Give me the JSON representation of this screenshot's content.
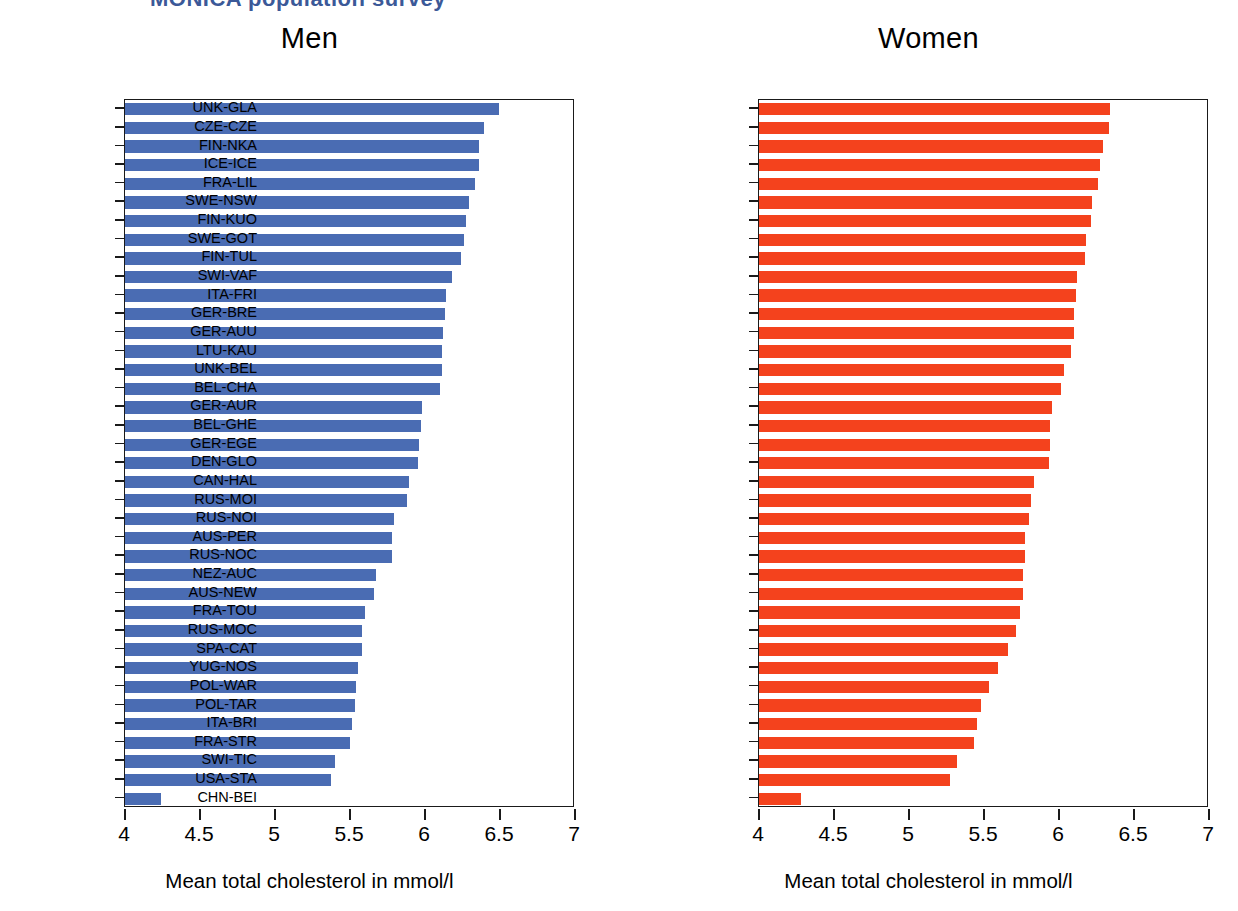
{
  "clipped_header": "MONICA population survey",
  "axis": {
    "x_title": "Mean total cholesterol in mmol/l",
    "x_ticks": [
      "4",
      "4.5",
      "5",
      "5.5",
      "6",
      "6.5",
      "7"
    ],
    "x_min": 4,
    "x_max": 7,
    "x_step": 0.5
  },
  "colors": {
    "men_bar": "#4a6cb3",
    "women_bar": "#f4421d",
    "axis": "#1a1a1a",
    "header": "#3b5998"
  },
  "panels": [
    {
      "id": "men",
      "title": "Men",
      "color_key": "men_bar"
    },
    {
      "id": "women",
      "title": "Women",
      "color_key": "women_bar"
    }
  ],
  "chart_data": [
    {
      "type": "bar",
      "orientation": "horizontal",
      "title": "Men",
      "xlabel": "Mean total cholesterol in mmol/l",
      "ylabel": "",
      "xlim": [
        4,
        7
      ],
      "grid": false,
      "legend": "none",
      "color": "#4a6cb3",
      "categories": [
        "FRA-LIL",
        "SWI-VAF",
        "FIN-KUO",
        "FIN-NKA",
        "CZE-CZE",
        "SWE-NSW",
        "ITA-FRI",
        "GER-AUU",
        "UNK-GLA",
        "FIN-TUL",
        "GER-AUR",
        "SWE-GOT",
        "ICE-ICE",
        "BEL-GHE",
        "BEL-CHA",
        "GER-BRE",
        "UNK-BEL",
        "LTU-KAU",
        "GER-EGE",
        "DEN-GLO",
        "CAN-HAL",
        "FRA-TOU",
        "AUS-PER",
        "AUS-NEW",
        "SPA-CAT",
        "NEZ-AUC",
        "RUS-MOI",
        "ITA-BRI",
        "FRA-STR",
        "RUS-NOC",
        "SWI-TIC",
        "POL-WAR",
        "RUS-MOC",
        "USA-STA",
        "RUS-NOI",
        "YUG-NOS",
        "POL-TAR",
        "CHN-BEI"
      ],
      "values": [
        6.49,
        6.39,
        6.36,
        6.36,
        6.33,
        6.29,
        6.27,
        6.26,
        6.24,
        6.18,
        6.14,
        6.13,
        6.12,
        6.11,
        6.11,
        6.1,
        5.98,
        5.97,
        5.96,
        5.95,
        5.89,
        5.88,
        5.79,
        5.78,
        5.78,
        5.67,
        5.66,
        5.6,
        5.58,
        5.58,
        5.55,
        5.54,
        5.53,
        5.51,
        5.5,
        5.4,
        5.37,
        4.24
      ]
    },
    {
      "type": "bar",
      "orientation": "horizontal",
      "title": "Women",
      "xlabel": "Mean total cholesterol in mmol/l",
      "ylabel": "",
      "xlim": [
        4,
        7
      ],
      "grid": false,
      "legend": "none",
      "color": "#f4421d",
      "categories": [
        "UNK-GLA",
        "CZE-CZE",
        "FIN-NKA",
        "ICE-ICE",
        "FRA-LIL",
        "SWE-NSW",
        "FIN-KUO",
        "SWE-GOT",
        "FIN-TUL",
        "SWI-VAF",
        "ITA-FRI",
        "GER-BRE",
        "GER-AUU",
        "LTU-KAU",
        "UNK-BEL",
        "BEL-CHA",
        "GER-AUR",
        "BEL-GHE",
        "GER-EGE",
        "DEN-GLO",
        "CAN-HAL",
        "RUS-MOI",
        "RUS-NOI",
        "AUS-PER",
        "RUS-NOC",
        "NEZ-AUC",
        "AUS-NEW",
        "FRA-TOU",
        "RUS-MOC",
        "SPA-CAT",
        "YUG-NOS",
        "POL-WAR",
        "POL-TAR",
        "ITA-BRI",
        "FRA-STR",
        "SWI-TIC",
        "USA-STA",
        "CHN-BEI"
      ],
      "values": [
        6.34,
        6.33,
        6.29,
        6.27,
        6.26,
        6.22,
        6.21,
        6.18,
        6.17,
        6.12,
        6.11,
        6.1,
        6.1,
        6.08,
        6.03,
        6.01,
        5.95,
        5.94,
        5.94,
        5.93,
        5.83,
        5.81,
        5.8,
        5.77,
        5.77,
        5.76,
        5.76,
        5.74,
        5.71,
        5.66,
        5.59,
        5.53,
        5.48,
        5.45,
        5.43,
        5.32,
        5.27,
        4.28
      ]
    }
  ]
}
